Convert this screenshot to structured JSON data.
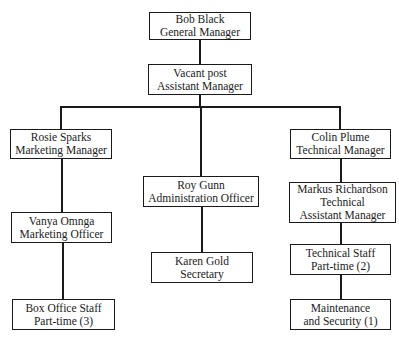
{
  "chart": {
    "type": "org-chart",
    "nodes": {
      "gm": {
        "name": "Bob Black",
        "role": "General Manager"
      },
      "am": {
        "name": "Vacant post",
        "role": "Assistant Manager"
      },
      "mm": {
        "name": "Rosie Sparks",
        "role": "Marketing Manager"
      },
      "mo": {
        "name": "Vanya Omnga",
        "role": "Marketing Officer"
      },
      "bo": {
        "name": "Box Office Staff",
        "role": "Part-time (3)"
      },
      "ao": {
        "name": "Roy Gunn",
        "role": "Administration Officer"
      },
      "sec": {
        "name": "Karen Gold",
        "role": "Secretary"
      },
      "tm": {
        "name": "Colin Plume",
        "role": "Technical Manager"
      },
      "tam": {
        "name": "Markus Richardson",
        "role": "Technical",
        "role2": "Assistant Manager"
      },
      "ts": {
        "name": "Technical Staff",
        "role": "Part-time (2)"
      },
      "ms": {
        "name": "Maintenance",
        "role": "and Security (1)"
      }
    },
    "edges": [
      [
        "gm",
        "am"
      ],
      [
        "am",
        "mm"
      ],
      [
        "am",
        "ao"
      ],
      [
        "am",
        "tm"
      ],
      [
        "mm",
        "mo"
      ],
      [
        "mo",
        "bo"
      ],
      [
        "ao",
        "sec"
      ],
      [
        "tm",
        "tam"
      ],
      [
        "tam",
        "ts"
      ],
      [
        "ts",
        "ms"
      ]
    ]
  }
}
